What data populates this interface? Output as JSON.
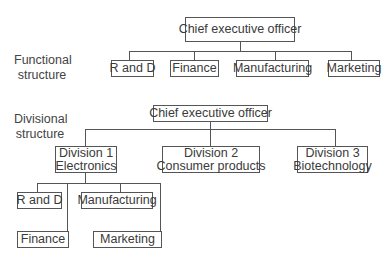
{
  "functional": {
    "label_line1": "Functional",
    "label_line2": "structure",
    "ceo": "Chief executive officer",
    "departments": [
      "R and D",
      "Finance",
      "Manufacturing",
      "Marketing"
    ]
  },
  "divisional": {
    "label_line1": "Divisional",
    "label_line2": "structure",
    "ceo": "Chief executive officer",
    "divisions": [
      {
        "line1": "Division 1",
        "line2": "Electronics"
      },
      {
        "line1": "Division 2",
        "line2": "Consumer products"
      },
      {
        "line1": "Division 3",
        "line2": "Biotechnology"
      }
    ],
    "division1_departments": [
      "R and D",
      "Manufacturing",
      "Finance",
      "Marketing"
    ]
  }
}
